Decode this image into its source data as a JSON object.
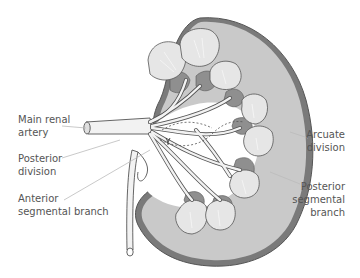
{
  "diagram": {
    "colors": {
      "cortex": "#c9c9c9",
      "capsule": "#7a7a7a",
      "medulla_dark": "#8f8f8f",
      "pyramid_light": "#e6e6e6",
      "vessel_fill": "#f2f2f2",
      "outline": "#555555",
      "leader": "#bbbbbb",
      "text": "#555555"
    },
    "labels": {
      "main_renal_artery": {
        "line1": "Main renal",
        "line2": "artery"
      },
      "posterior_division": {
        "line1": "Posterior",
        "line2": "division"
      },
      "anterior_segmental_branch": {
        "line1": "Anterior",
        "line2": "segmental branch"
      },
      "arcuate_division": {
        "line1": "Arcuate",
        "line2": "division"
      },
      "posterior_segmental_branch": {
        "line1": "Posterior",
        "line2": "segmental",
        "line3": "branch"
      }
    }
  }
}
